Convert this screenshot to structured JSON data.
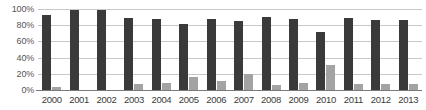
{
  "chart_data": {
    "type": "bar",
    "title": "",
    "xlabel": "",
    "ylabel": "",
    "ylim": [
      0,
      100
    ],
    "ytick_labels": [
      "100%",
      "80%",
      "60%",
      "40%",
      "20%",
      "0%"
    ],
    "ytick_values": [
      100,
      80,
      60,
      40,
      20,
      0
    ],
    "grid": true,
    "legend": "none",
    "categories": [
      "2000",
      "2001",
      "2002",
      "2003",
      "2004",
      "2005",
      "2006",
      "2007",
      "2008",
      "2009",
      "2010",
      "2011",
      "2012",
      "2013"
    ],
    "series": [
      {
        "name": "primary",
        "color": "#3a3a3a",
        "values": [
          93,
          99,
          99,
          89,
          88,
          82,
          88,
          85,
          90,
          88,
          72,
          89,
          87,
          87
        ]
      },
      {
        "name": "secondary",
        "color": "#a3a3a3",
        "values": [
          4,
          0,
          0,
          7,
          9,
          16,
          11,
          20,
          6,
          9,
          31,
          8,
          8,
          7
        ]
      }
    ]
  }
}
